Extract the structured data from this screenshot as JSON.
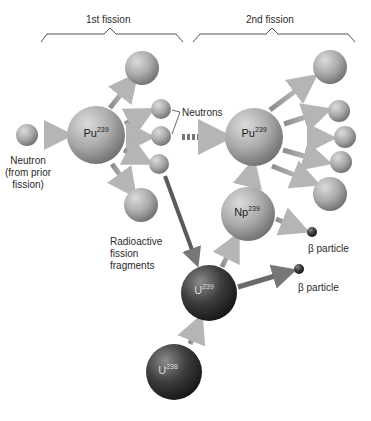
{
  "headers": {
    "first": "1st fission",
    "second": "2nd fission"
  },
  "labels": {
    "neutron_in": [
      "Neutron",
      "(from prior",
      "fission)"
    ],
    "neutrons": "Neutrons",
    "fragments": [
      "Radioactive",
      "fission",
      "fragments"
    ],
    "beta1": "β particle",
    "beta2": "β particle"
  },
  "nuclei": {
    "pu1": {
      "symbol": "Pu",
      "mass": "239"
    },
    "pu2": {
      "symbol": "Pu",
      "mass": "239"
    },
    "np": {
      "symbol": "Np",
      "mass": "239"
    },
    "u239": {
      "symbol": "U",
      "mass": "239"
    },
    "u238": {
      "symbol": "U",
      "mass": "238"
    }
  },
  "colors": {
    "sphere_light": "#b8b8b8",
    "sphere_dark": "#3a3a3a",
    "arrow": "#a0a0a0",
    "bracket": "#555555"
  }
}
